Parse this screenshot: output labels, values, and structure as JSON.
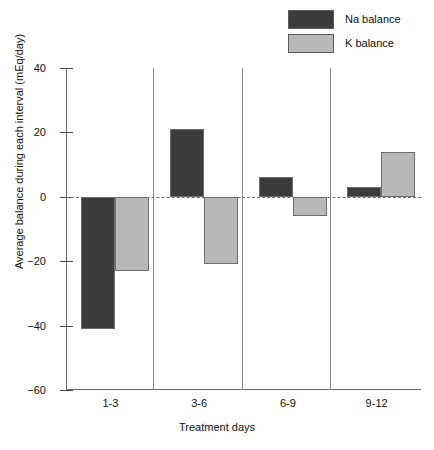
{
  "chart_data": {
    "type": "bar",
    "title": "",
    "subtitle": "",
    "categories": [
      "1-3",
      "3-6",
      "6-9",
      "9-12"
    ],
    "series": [
      {
        "name": "Na balance",
        "values": [
          -41,
          21,
          6,
          3
        ],
        "color": "#3b3b3b"
      },
      {
        "name": "K balance",
        "values": [
          -23,
          -21,
          -6,
          14
        ],
        "color": "#b8b8b8"
      }
    ],
    "xlabel": "Treatment days",
    "ylabel": "Average balance during each interval (mEq/day)",
    "ylim": [
      -60,
      40
    ],
    "yticks": [
      40,
      20,
      0,
      -20,
      -40,
      -60
    ],
    "ytick_labels": [
      "40",
      "20",
      "0",
      "−20",
      "−40",
      "−60"
    ],
    "grid": false,
    "zero_line": true,
    "group_separators": true,
    "legend_position": "top-right",
    "units": "mEq/day"
  },
  "legend": {
    "items": [
      {
        "label": "Na balance",
        "swatch": "#3b3b3b"
      },
      {
        "label": "K balance",
        "swatch": "#b8b8b8"
      }
    ]
  },
  "axes": {
    "y_title": "Average balance during each interval (mEq/day)",
    "x_title": "Treatment days",
    "y_ticks": [
      "40",
      "20",
      "0",
      "−20",
      "−40",
      "−60"
    ],
    "x_ticks": [
      "1-3",
      "3-6",
      "6-9",
      "9-12"
    ]
  }
}
